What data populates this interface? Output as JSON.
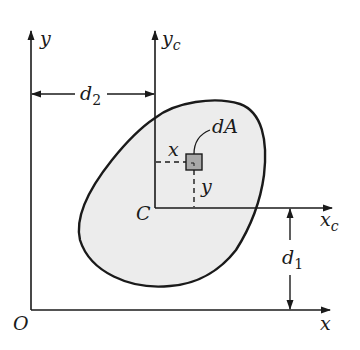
{
  "diagram": {
    "labels": {
      "y_axis": "y",
      "x_axis": "x",
      "origin": "O",
      "yc_axis": "y",
      "yc_sub": "c",
      "xc_axis": "x",
      "xc_sub": "c",
      "centroid": "C",
      "d2": "d",
      "d2_sub": "2",
      "d1": "d",
      "d1_sub": "1",
      "dA": "dA",
      "elem_x": "x",
      "elem_y": "y"
    },
    "colors": {
      "stroke": "#1a1a1a",
      "area_fill": "#ececec",
      "element_fill": "#a8a8a8"
    }
  }
}
